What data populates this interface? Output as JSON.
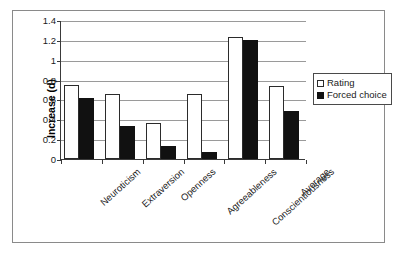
{
  "chart_data": {
    "type": "bar",
    "title": "",
    "subtitle": "",
    "xlabel": "",
    "ylabel": "Increase (d)",
    "ylim": [
      0,
      1.4
    ],
    "yticks": [
      "0",
      "0.2",
      "0.4",
      "0.6",
      "0.8",
      "1",
      "1.2",
      "1.4"
    ],
    "ytick_values": [
      0,
      0.2,
      0.4,
      0.6,
      0.8,
      1.0,
      1.2,
      1.4
    ],
    "grid": true,
    "legend_position": "right-outside",
    "categories": [
      "Neuroticism",
      "Extraversion",
      "Openness",
      "Agreeableness",
      "Conscientiousness",
      "Average"
    ],
    "series": [
      {
        "name": "Rating",
        "color": "#ffffff",
        "edge_color": "#2b2b2b",
        "values": [
          0.75,
          0.65,
          0.36,
          0.65,
          1.23,
          0.74
        ]
      },
      {
        "name": "Forced choice",
        "color": "#111111",
        "edge_color": "#111111",
        "values": [
          0.61,
          0.33,
          0.13,
          0.07,
          1.2,
          0.48
        ]
      }
    ]
  },
  "legend": {
    "entries": [
      {
        "label": "Rating",
        "swatch": "open-square"
      },
      {
        "label": "Forced choice",
        "swatch": "filled-square"
      }
    ]
  },
  "colors": {
    "axis": "#3a3a3a",
    "gridline": "#9a9a9a",
    "frame": "#8a8a8a",
    "text": "#1a1a1a",
    "rating_fill": "#ffffff",
    "forced_fill": "#111111"
  }
}
